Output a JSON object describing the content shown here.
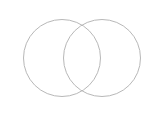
{
  "figure": {
    "title": "",
    "caption": "",
    "background_color": "#ffffff",
    "width": 157,
    "height": 124
  },
  "diagram": {
    "type": "venn",
    "set_count": 2,
    "stroke_color": "#b8b8b8",
    "stroke_width": 1,
    "fill_color": "#ffffff",
    "labels": [],
    "region_labels": [],
    "circles": [
      {
        "name": "left-set",
        "cx": 62,
        "cy": 58,
        "r": 38.5,
        "label": "",
        "count_label": ""
      },
      {
        "name": "right-set",
        "cx": 102,
        "cy": 58,
        "r": 38.5,
        "label": "",
        "count_label": ""
      }
    ]
  }
}
